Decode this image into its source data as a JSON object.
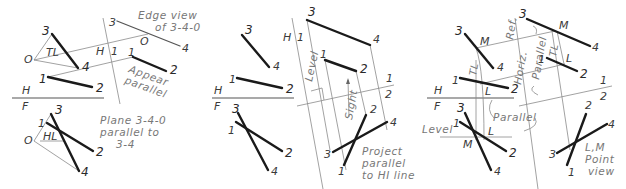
{
  "figure": {
    "panels": [
      {
        "id": "panel-1",
        "ref_line": {
          "top": "H",
          "bottom": "F"
        },
        "aux_ref": {
          "left": "H",
          "right": "1"
        },
        "labels": {
          "p3": "3",
          "p4": "4",
          "p1": "1",
          "p2": "2",
          "o": "O",
          "tl": "TL",
          "hl": "HL",
          "f3": "3",
          "f4": "4",
          "f1": "1",
          "f2": "2",
          "fo": "O",
          "a3": "3",
          "a4": "4",
          "a1": "1",
          "a2": "2",
          "ao": "O"
        },
        "notes": {
          "edge_view_1": "Edge view",
          "edge_view_2": "of 3-4-0",
          "appear_1": "Appear",
          "appear_2": "parallel",
          "plane_1": "Plane 3-4-0",
          "plane_2": "parallel to",
          "plane_3": "3-4"
        }
      },
      {
        "id": "panel-2",
        "ref_line": {
          "top": "H",
          "bottom": "F"
        },
        "aux_ref": {
          "left": "H",
          "right": "1"
        },
        "aux_ref2": {
          "top": "1",
          "bottom": "2"
        },
        "labels": {
          "p3": "3",
          "p4": "4",
          "p1": "1",
          "p2": "2",
          "f3": "3",
          "f4": "4",
          "f1": "1",
          "f2": "2",
          "a3": "3",
          "a4": "4",
          "a1": "1",
          "a2": "2",
          "b3": "3",
          "b4": "4",
          "b1": "1",
          "b2": "2"
        },
        "notes": {
          "level": "Level",
          "sight": "Sight",
          "project_1": "Project",
          "project_2": "parallel",
          "project_3": "to HI line"
        }
      },
      {
        "id": "panel-3",
        "ref_line": {
          "top": "H",
          "bottom": "F"
        },
        "aux_ref2": {
          "top": "1",
          "bottom": "2"
        },
        "labels": {
          "p3": "3",
          "p4": "4",
          "p1": "1",
          "p2": "2",
          "pm": "M",
          "pl": "L",
          "ptl": "TL",
          "f3": "3",
          "f4": "4",
          "f1": "1",
          "f2": "2",
          "fm": "M",
          "fl": "L",
          "a3": "3",
          "a4": "4",
          "a1": "1",
          "a2": "2",
          "am": "M",
          "al": "L",
          "atl": "TL",
          "b3": "3",
          "b4": "4",
          "b1": "1",
          "b2": "2"
        },
        "notes": {
          "horiz": "Horiz.",
          "ref": "Ref.",
          "parallel_v": "Parallel",
          "parallel_h": "Parallel",
          "level": "Level",
          "lm": "L,M",
          "point": "Point",
          "view": "view"
        }
      }
    ]
  }
}
